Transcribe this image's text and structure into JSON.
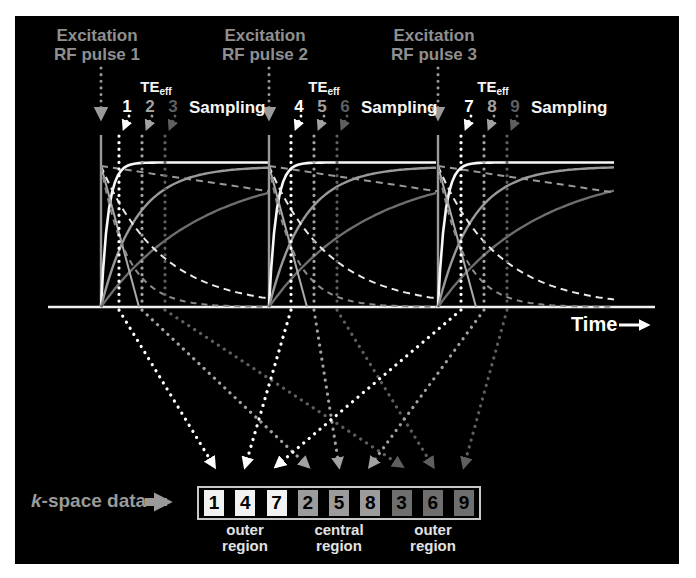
{
  "figure_type": "MRI k-space ordering schematic",
  "segments": [
    {
      "title_line1": "Excitation",
      "title_line2": "RF pulse 1",
      "te_main": "TE",
      "te_sub": "eff",
      "sampling": "Sampling",
      "numbers": [
        "1",
        "2",
        "3"
      ]
    },
    {
      "title_line1": "Excitation",
      "title_line2": "RF pulse 2",
      "te_main": "TE",
      "te_sub": "eff",
      "sampling": "Sampling",
      "numbers": [
        "4",
        "5",
        "6"
      ]
    },
    {
      "title_line1": "Excitation",
      "title_line2": "RF pulse 3",
      "te_main": "TE",
      "te_sub": "eff",
      "sampling": "Sampling",
      "numbers": [
        "7",
        "8",
        "9"
      ]
    }
  ],
  "time_axis": {
    "label": "Time"
  },
  "kspace": {
    "label_prefix_italic": "k",
    "label_rest": "-space data",
    "cells": [
      {
        "value": "1",
        "group": 0
      },
      {
        "value": "4",
        "group": 0
      },
      {
        "value": "7",
        "group": 0
      },
      {
        "value": "2",
        "group": 1
      },
      {
        "value": "5",
        "group": 1
      },
      {
        "value": "8",
        "group": 1
      },
      {
        "value": "3",
        "group": 2
      },
      {
        "value": "6",
        "group": 2
      },
      {
        "value": "9",
        "group": 2
      }
    ],
    "regions": [
      {
        "line1": "outer",
        "line2": "region"
      },
      {
        "line1": "central",
        "line2": "region"
      },
      {
        "line1": "outer",
        "line2": "region"
      }
    ]
  },
  "colors": {
    "page_bg": "#ffffff",
    "panel_bg": "#000000",
    "excitation_label": "#8f8f8f",
    "pulse_line": "#9a9a9a",
    "te_label": "#f5f5f5",
    "sampling_label": "#f5f5f5",
    "time_label": "#ffffff",
    "axis": "#f0f0f0",
    "sample_colors": [
      "#ffffff",
      "#a2a2a2",
      "#5f5f5f"
    ],
    "cell_fills": [
      "#f2f2f2",
      "#9c9c9c",
      "#6e6e6e"
    ],
    "cell_text": "#000000",
    "strip_border": "#c8c8c8",
    "kspace_label": "#9a9a9a",
    "kspace_arrow": "#9a9a9a",
    "region_label": "#e2e2e2",
    "curves": {
      "rise_fast": "#f8f8f8",
      "rise_mid": "#9a9a9a",
      "rise_slow": "#6e6e6e",
      "decay_dashed_fast": "#8a8a8a",
      "decay_dashed_mid": "#e8e8e8",
      "decay_dashed_shallow": "#9a9a9a",
      "decay_steep_line": "#ababab"
    }
  },
  "geometry": {
    "panel": {
      "left": 15,
      "top": 16,
      "width": 664,
      "height": 548
    },
    "axis": {
      "y": 291,
      "x1": 33,
      "x2": 640
    },
    "pulses": [
      86,
      254,
      423
    ],
    "seg_curve_end": [
      254,
      423,
      600
    ],
    "samples": [
      [
        104,
        127,
        150
      ],
      [
        276,
        299,
        322
      ],
      [
        446,
        469,
        492
      ]
    ],
    "pulse_line_top": 119,
    "dotted_vertical_top": 120,
    "excitation_arrow": {
      "y1": 52,
      "y2": 101
    },
    "plateau": {
      "white_y": 146.5,
      "gray_y": 150.5,
      "start_y": 150,
      "rise_tau": [
        7,
        35,
        100
      ],
      "decay_tau": [
        60,
        26
      ],
      "steep_run": 38,
      "shallow_slope": 0.15
    },
    "labels": {
      "excitation_top": 10,
      "te_top": 62,
      "te_dx": 55,
      "numbers_top": 82,
      "number_dx": 8,
      "sampling_top": 82,
      "sampling_dx": 24,
      "time": {
        "left": 556,
        "top": 297
      },
      "time_arrow": {
        "x1": 604,
        "x2": 632,
        "y": 309
      },
      "kspace_label": {
        "left": 16,
        "top": 474
      },
      "kspace_arrow": {
        "x1": 130,
        "x2": 152,
        "y": 486
      },
      "regions_top": 506,
      "region_centers": [
        230,
        324,
        418
      ]
    },
    "strip": {
      "left": 182,
      "top": 470,
      "width": 284,
      "height": 34,
      "cell_w": 20,
      "cell_h": 26,
      "pitch": 31.25,
      "first_offset": 5,
      "first_center": 199
    },
    "cell_order": [
      1,
      4,
      7,
      2,
      5,
      8,
      3,
      6,
      9
    ],
    "convergence": {
      "y_start": 294,
      "y_end": 450
    }
  }
}
